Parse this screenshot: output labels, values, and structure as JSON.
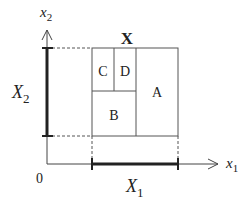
{
  "diagram": {
    "title": "X",
    "axes": {
      "x_label": "x",
      "x_sub": "1",
      "y_label": "x",
      "y_sub": "2",
      "origin": "0"
    },
    "intervals": {
      "x_interval": "X",
      "x_interval_sub": "1",
      "y_interval": "X",
      "y_interval_sub": "2"
    },
    "regions": [
      "A",
      "B",
      "C",
      "D"
    ],
    "colors": {
      "line": "#444444",
      "thick": "#222222",
      "text": "#222222"
    }
  }
}
